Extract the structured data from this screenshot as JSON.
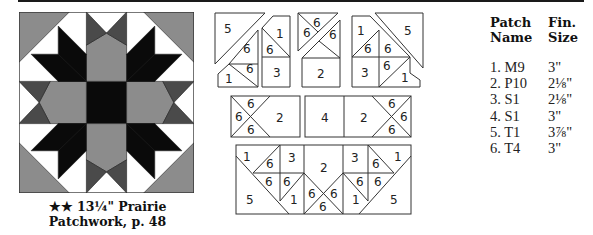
{
  "colors": {
    "light_gray": "#8c8c8c",
    "dark_gray": "#4a4a4a",
    "black": "#0a0a0a",
    "white": "#ffffff",
    "outline": "#333333"
  },
  "block": {
    "caption_line1": "★★ 13¼\" Prairie",
    "caption_line2": "Patchwork, p. 48",
    "stars": 2,
    "finished_size": "13¼\"",
    "name": "Prairie Patchwork",
    "page": "p. 48"
  },
  "diagrams": {
    "top_left": {
      "labels": [
        "5",
        "6",
        "6",
        "1",
        "1",
        "6",
        "3"
      ]
    },
    "top_center": {
      "labels": [
        "6",
        "6",
        "6",
        "2"
      ]
    },
    "top_right": {
      "labels": [
        "1",
        "6",
        "6",
        "3",
        "6",
        "1",
        "5"
      ]
    },
    "mid_left": {
      "labels": [
        "6",
        "6",
        "6",
        "2"
      ]
    },
    "mid_right": {
      "labels": [
        "4",
        "2",
        "6",
        "6",
        "6"
      ]
    },
    "bottom": {
      "labels": [
        "1",
        "6",
        "3",
        "6",
        "6",
        "5",
        "1",
        "2",
        "6",
        "6",
        "6",
        "3",
        "6",
        "1",
        "6",
        "6",
        "1",
        "5"
      ]
    }
  },
  "table": {
    "headers": {
      "name_line1": "Patch",
      "name_line2": "Name",
      "size_line1": "Fin.",
      "size_line2": "Size"
    },
    "rows": [
      {
        "name": "1. M9",
        "size": "3\""
      },
      {
        "name": "2. P10",
        "size": "2⅛\""
      },
      {
        "name": "3. S1",
        "size": "2⅛\""
      },
      {
        "name": "4. S1",
        "size": "3\""
      },
      {
        "name": "5. T1",
        "size": "3⅞\""
      },
      {
        "name": "6. T4",
        "size": "3\""
      }
    ]
  }
}
